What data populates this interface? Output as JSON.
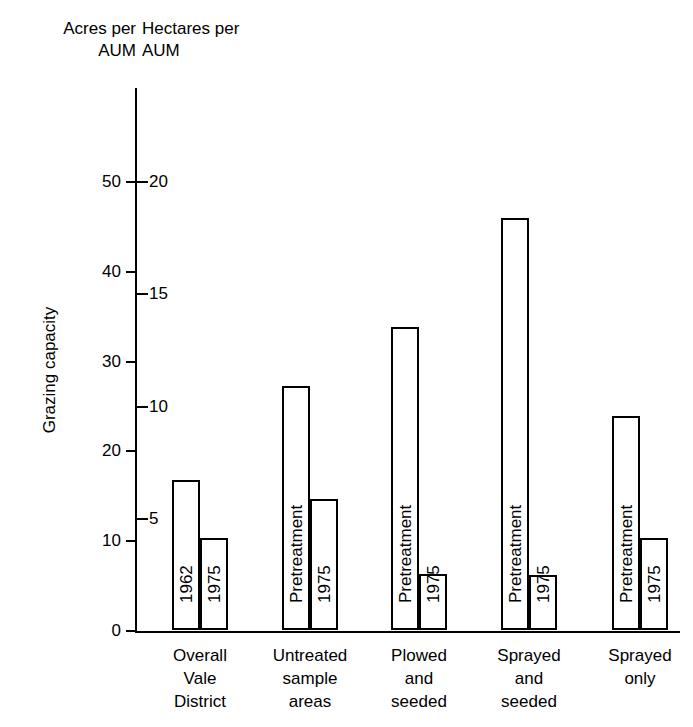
{
  "chart_data": {
    "type": "bar",
    "title": "",
    "ylabel": "Grazing capacity",
    "xlabel": "",
    "grid": false,
    "legend": "none",
    "axes": {
      "left": {
        "header": "Acres per\nAUM",
        "ticks": [
          0,
          10,
          20,
          30,
          40,
          50
        ],
        "tick_labels": [
          "0",
          "10",
          "20",
          "30",
          "40",
          "50"
        ],
        "ylim": [
          0,
          50
        ]
      },
      "right_inner": {
        "header": "Hectares per\nAUM",
        "ticks": [
          5,
          10,
          15,
          20
        ],
        "tick_labels": [
          "5",
          "10",
          "15",
          "20"
        ],
        "ylim": [
          0,
          20
        ]
      }
    },
    "categories": [
      "Overall\nVale\nDistrict",
      "Untreated\nsample\nareas",
      "Plowed\nand\nseeded",
      "Sprayed\nand\nseeded",
      "Sprayed\nonly"
    ],
    "series": [
      {
        "name": "Before",
        "bar_labels": [
          "1962",
          "Pretreatment",
          "Pretreatment",
          "Pretreatment",
          "Pretreatment"
        ],
        "values": [
          16.7,
          27.2,
          33.7,
          45.9,
          23.8
        ]
      },
      {
        "name": "After",
        "bar_labels": [
          "1975",
          "1975",
          "1975",
          "1975",
          "1975"
        ],
        "values": [
          10.2,
          14.6,
          6.2,
          6.1,
          10.2
        ]
      }
    ],
    "units_note": "Left scale in acres per AUM; inner scale in hectares per AUM (1 hectare per AUM = 2.47 acres per AUM)"
  },
  "colors": {
    "ink": "#000000",
    "background": "#ffffff",
    "bar_fill": "#ffffff",
    "bar_stroke": "#000000"
  }
}
